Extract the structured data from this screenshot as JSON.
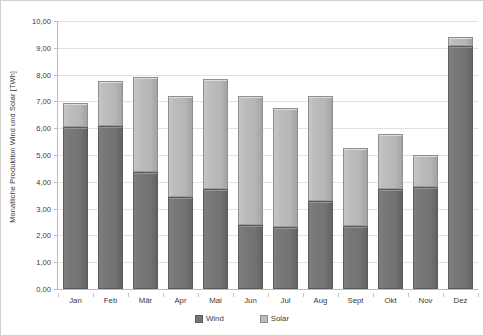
{
  "chart_data": {
    "type": "bar",
    "subtype": "stacked",
    "title": "",
    "xlabel": "",
    "ylabel": "Monatliche Produktion Wind und Solar [TWh]",
    "ylim": [
      0,
      10
    ],
    "ytick_step": 1,
    "grid": true,
    "legend_position": "bottom",
    "categories": [
      "Jan",
      "Feb",
      "Mär",
      "Apr",
      "Mai",
      "Jun",
      "Jul",
      "Aug",
      "Sept",
      "Okt",
      "Nov",
      "Dez"
    ],
    "ytick_labels": [
      "10,00",
      "9,00",
      "8,00",
      "7,00",
      "6,00",
      "5,00",
      "4,00",
      "3,00",
      "2,00",
      "1,00",
      "0,00"
    ],
    "ytick_values": [
      10,
      9,
      8,
      7,
      6,
      5,
      4,
      3,
      2,
      1,
      0
    ],
    "series": [
      {
        "name": "Wind",
        "color": "#757575",
        "values": [
          6.05,
          6.1,
          4.35,
          3.45,
          3.75,
          2.4,
          2.3,
          3.3,
          2.35,
          3.75,
          3.8,
          9.05
        ]
      },
      {
        "name": "Solar",
        "color": "#bdbdbd",
        "values": [
          0.9,
          1.65,
          3.55,
          3.75,
          4.1,
          4.8,
          4.45,
          3.9,
          2.9,
          2.05,
          1.2,
          0.35
        ]
      }
    ],
    "totals": [
      6.95,
      7.75,
      7.9,
      7.2,
      7.85,
      7.2,
      6.75,
      7.2,
      5.25,
      5.8,
      5.0,
      9.4
    ]
  },
  "legend": {
    "items": [
      {
        "label": "Wind",
        "icon": "square-swatch-icon"
      },
      {
        "label": "Solar",
        "icon": "square-swatch-icon"
      }
    ]
  }
}
